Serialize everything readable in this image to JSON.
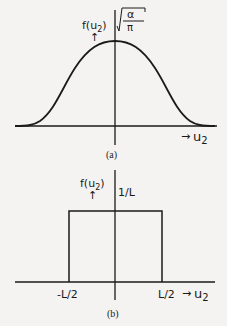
{
  "figure_a": {
    "caption": "(a)",
    "y_label": "f(u",
    "y_label_sub": "2",
    "y_label_close": ")",
    "y_arrow": "↑",
    "peak_label_num": "α",
    "peak_label_den": "π",
    "x_arrow": "→",
    "x_label": "u",
    "x_label_sub": "2",
    "curve": "gaussian"
  },
  "figure_b": {
    "caption": "(b)",
    "y_label": "f(u",
    "y_label_sub": "2",
    "y_label_close": ")",
    "y_arrow": "↑",
    "height_label": "1/L",
    "left_tick": "-L/2",
    "right_tick": "L/2",
    "x_arrow": "→",
    "x_label": "u",
    "x_label_sub": "2",
    "curve": "rectangular"
  }
}
